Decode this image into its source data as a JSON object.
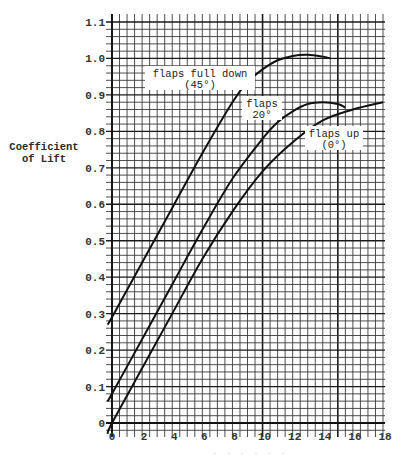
{
  "chart_data": {
    "type": "line",
    "title": "",
    "xlabel": "",
    "ylabel": "Coefficient of Lift",
    "ylabel_lines": [
      "Coefficient",
      "of Lift"
    ],
    "xlim": [
      0,
      18
    ],
    "ylim": [
      0,
      1.1
    ],
    "x_ticks": [
      0,
      2,
      4,
      6,
      8,
      10,
      12,
      14,
      16,
      18
    ],
    "y_ticks": [
      "0",
      "0.1",
      "0.2",
      "0.3",
      "0.4",
      "0.5",
      "0.6",
      "0.7",
      "0.8",
      "0.9",
      "1.0",
      "1.1"
    ],
    "grid": true,
    "legend": "inline labels",
    "series": [
      {
        "name": "flaps full down (45°)",
        "label_lines": [
          "flaps full down",
          "(45°)"
        ],
        "x": [
          -0.3,
          0,
          2,
          4,
          6,
          8,
          9,
          10,
          11,
          12,
          13,
          14,
          14.5
        ],
        "y": [
          0.27,
          0.29,
          0.44,
          0.59,
          0.74,
          0.88,
          0.935,
          0.97,
          0.995,
          1.007,
          1.01,
          1.005,
          1.0
        ]
      },
      {
        "name": "flaps 20°",
        "label_lines": [
          "flaps",
          "20°"
        ],
        "x": [
          -0.3,
          0,
          2,
          4,
          6,
          8,
          10,
          11,
          12,
          13,
          14,
          15,
          15.5
        ],
        "y": [
          0.06,
          0.08,
          0.23,
          0.38,
          0.53,
          0.67,
          0.78,
          0.825,
          0.855,
          0.875,
          0.88,
          0.875,
          0.865
        ]
      },
      {
        "name": "flaps up (0°)",
        "label_lines": [
          "flaps up",
          "(0°)"
        ],
        "x": [
          -0.3,
          0,
          2,
          4,
          6,
          8,
          10,
          12,
          14,
          16,
          18
        ],
        "y": [
          -0.03,
          0.0,
          0.15,
          0.3,
          0.45,
          0.58,
          0.69,
          0.77,
          0.83,
          0.86,
          0.88
        ]
      }
    ]
  },
  "axis_label_faint": ". . . . . ."
}
